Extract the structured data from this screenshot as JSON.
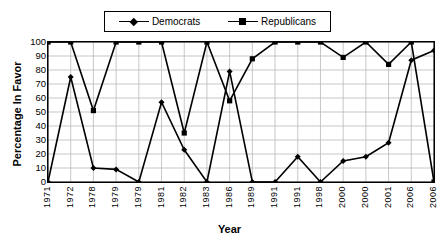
{
  "chart_data": {
    "type": "line",
    "title": "",
    "xlabel": "Year",
    "ylabel": "Percentage In Favor",
    "categories": [
      "1971",
      "1972",
      "1978",
      "1979",
      "1979",
      "1981",
      "1982",
      "1983",
      "1986",
      "1989",
      "1991",
      "1991",
      "1998",
      "2000",
      "2000",
      "2001",
      "2006",
      "2006"
    ],
    "ylim": [
      0,
      100
    ],
    "ytick_step": 10,
    "yticks": [
      "100",
      "90",
      "80",
      "70",
      "60",
      "50",
      "40",
      "30",
      "20",
      "10",
      "0"
    ],
    "grid": true,
    "legend_position": "top-center",
    "series": [
      {
        "name": "Democrats",
        "marker": "diamond",
        "color": "#000000",
        "values": [
          0,
          75,
          10,
          9,
          0,
          57,
          23,
          0,
          79,
          0,
          0,
          18,
          0,
          15,
          18,
          28,
          87,
          94
        ]
      },
      {
        "name": "Republicans",
        "marker": "square",
        "color": "#000000",
        "values": [
          100,
          100,
          51,
          100,
          100,
          100,
          35,
          100,
          58,
          88,
          100,
          100,
          100,
          89,
          100,
          84,
          100,
          0
        ]
      }
    ]
  },
  "legend": {
    "entries": [
      {
        "label": "Democrats"
      },
      {
        "label": "Republicans"
      }
    ]
  },
  "axes": {
    "y_title": "Percentage In Favor",
    "x_title": "Year"
  },
  "footer": {
    "caption": ""
  }
}
